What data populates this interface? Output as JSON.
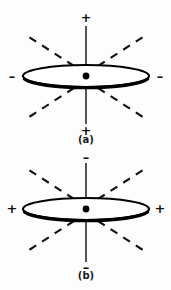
{
  "figure": {
    "background_color": "#fdfdfd",
    "ink_color": "#000000",
    "panels": [
      {
        "id": "a",
        "caption": "(a)",
        "caption_x": 86,
        "caption_y": 143,
        "center_x": 86,
        "center_y": 76,
        "disk_rx": 63,
        "disk_ry": 11,
        "axis_top_y": 26,
        "axis_bottom_y": 124,
        "signs": [
          {
            "name": "top-sign",
            "label": "+",
            "x": 86,
            "y": 17
          },
          {
            "name": "bottom-sign",
            "label": "+",
            "x": 86,
            "y": 130
          },
          {
            "name": "left-sign",
            "label": "–",
            "x": 12,
            "y": 76
          },
          {
            "name": "right-sign",
            "label": "–",
            "x": 160,
            "y": 76
          }
        ],
        "asymptotes": [
          {
            "name": "upper-left",
            "x1": 74,
            "y1": 66,
            "x2": 29,
            "y2": 37
          },
          {
            "name": "upper-right",
            "x1": 98,
            "y1": 66,
            "x2": 143,
            "y2": 37
          },
          {
            "name": "lower-left",
            "x1": 74,
            "y1": 88,
            "x2": 26,
            "y2": 119
          },
          {
            "name": "lower-right",
            "x1": 98,
            "y1": 88,
            "x2": 146,
            "y2": 119
          }
        ]
      },
      {
        "id": "b",
        "caption": "(b)",
        "caption_x": 86,
        "caption_y": 279,
        "center_x": 86,
        "center_y": 209,
        "disk_rx": 63,
        "disk_ry": 11,
        "axis_top_y": 163,
        "axis_bottom_y": 262,
        "signs": [
          {
            "name": "top-sign",
            "label": "–",
            "x": 86,
            "y": 157
          },
          {
            "name": "bottom-sign",
            "label": "–",
            "x": 86,
            "y": 267
          },
          {
            "name": "left-sign",
            "label": "+",
            "x": 12,
            "y": 208
          },
          {
            "name": "right-sign",
            "label": "+",
            "x": 160,
            "y": 208
          }
        ],
        "asymptotes": [
          {
            "name": "upper-left",
            "x1": 74,
            "y1": 199,
            "x2": 29,
            "y2": 170
          },
          {
            "name": "upper-right",
            "x1": 98,
            "y1": 199,
            "x2": 143,
            "y2": 170
          },
          {
            "name": "lower-left",
            "x1": 74,
            "y1": 221,
            "x2": 26,
            "y2": 252
          },
          {
            "name": "lower-right",
            "x1": 98,
            "y1": 221,
            "x2": 146,
            "y2": 252
          }
        ]
      }
    ]
  }
}
